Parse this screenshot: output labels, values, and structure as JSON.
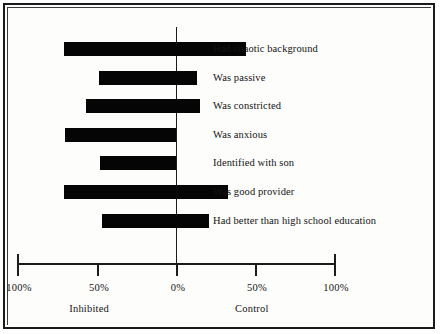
{
  "chart_data": {
    "type": "bar",
    "orientation": "horizontal",
    "style": "diverging-bar",
    "title": "",
    "subtitle": "",
    "xlabel": "",
    "ylabel": "",
    "xlim": [
      -100,
      100
    ],
    "grid": false,
    "legend": null,
    "zero_reference": "0%",
    "axis": {
      "tick_labels": [
        "100%",
        "50%",
        "0%",
        "50%",
        "100%"
      ],
      "tick_values": [
        -100,
        -50,
        0,
        50,
        100
      ],
      "tick_positions_px": [
        15,
        95,
        174,
        253,
        332
      ],
      "group_labels": [
        {
          "text": "Inhibited",
          "side": "left",
          "center_value": -55
        },
        {
          "text": "Control",
          "side": "right",
          "center_value": 48
        }
      ]
    },
    "categories": [
      "Had chaotic background",
      "Was passive",
      "Was constricted",
      "Was anxious",
      "Identified with son",
      "Was good provider",
      "Had better than high school education"
    ],
    "series": [
      {
        "name": "Inhibited",
        "direction": "left",
        "values": [
          -71,
          -49,
          -57,
          -70,
          -48,
          -71,
          -47
        ]
      },
      {
        "name": "Control",
        "direction": "right",
        "values": [
          44,
          13,
          15,
          0,
          0,
          33,
          21
        ]
      }
    ],
    "bars": [
      {
        "label": "Had chaotic background",
        "inhibited": -71,
        "control": 44
      },
      {
        "label": "Was passive",
        "inhibited": -49,
        "control": 13
      },
      {
        "label": "Was constricted",
        "inhibited": -57,
        "control": 15
      },
      {
        "label": "Was anxious",
        "inhibited": -70,
        "control": 0
      },
      {
        "label": "Identified with son",
        "inhibited": -48,
        "control": 0
      },
      {
        "label": "Was good provider",
        "inhibited": -71,
        "control": 33
      },
      {
        "label": "Had better than high school education",
        "inhibited": -47,
        "control": 21
      }
    ],
    "colors": {
      "bar": "#050505",
      "axis": "#1c1c1c",
      "text": "#131313",
      "background": "#fdfdfc",
      "frame": "#1a1a1a"
    }
  }
}
